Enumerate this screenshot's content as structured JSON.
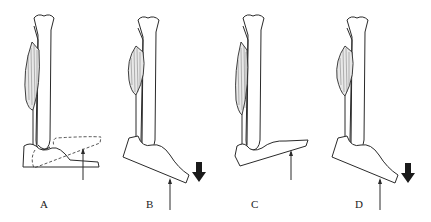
{
  "figure": {
    "panels": [
      {
        "id": "A",
        "label": "A",
        "description": "neutral foot with dashed dorsiflexed outline, upward force arrow"
      },
      {
        "id": "B",
        "label": "B",
        "description": "plantarflexed foot, upward force arrow, downward bold arrow, contracted muscle"
      },
      {
        "id": "C",
        "label": "C",
        "description": "foot dorsiflexed, upward force arrow, elongated muscle"
      },
      {
        "id": "D",
        "label": "D",
        "description": "plantarflexed foot, upward force arrow, downward bold arrow, contracted muscle"
      }
    ],
    "colors": {
      "line": "#2a2a2a",
      "background": "#ffffff",
      "arrow_fill": "#1a1a1a"
    }
  }
}
